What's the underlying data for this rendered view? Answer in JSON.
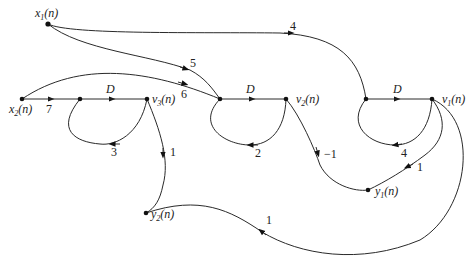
{
  "diagram": {
    "type": "signal-flow-graph",
    "nodes": {
      "x1": {
        "label": "x",
        "sub": "1",
        "arg": "(n)"
      },
      "x2": {
        "label": "x",
        "sub": "2",
        "arg": "(n)"
      },
      "v3": {
        "label": "v",
        "sub": "3",
        "arg": "(n)"
      },
      "v2": {
        "label": "v",
        "sub": "2",
        "arg": "(n)"
      },
      "v1": {
        "label": "v",
        "sub": "1",
        "arg": "(n)"
      },
      "y1": {
        "label": "y",
        "sub": "1",
        "arg": "(n)"
      },
      "y2": {
        "label": "y",
        "sub": "2",
        "arg": "(n)"
      }
    },
    "edges": [
      {
        "from": "x2",
        "to": "a3",
        "gain": "7"
      },
      {
        "from": "a3",
        "to": "v3",
        "gain": "D"
      },
      {
        "from": "v3",
        "to": "a3",
        "gain": "3"
      },
      {
        "from": "v3",
        "to": "y2",
        "gain": "1"
      },
      {
        "from": "x2",
        "to": "a2",
        "gain": "6"
      },
      {
        "from": "x1",
        "to": "a2",
        "gain": "5"
      },
      {
        "from": "a2",
        "to": "v2",
        "gain": "D"
      },
      {
        "from": "v2",
        "to": "a2",
        "gain": "2"
      },
      {
        "from": "v2",
        "to": "y1",
        "gain": "-1"
      },
      {
        "from": "x1",
        "to": "a1",
        "gain": "4"
      },
      {
        "from": "a1",
        "to": "v1",
        "gain": "D"
      },
      {
        "from": "v1",
        "to": "a1",
        "gain": "4"
      },
      {
        "from": "v1",
        "to": "y1",
        "gain": "1"
      },
      {
        "from": "v1",
        "to": "y2",
        "gain": "1"
      }
    ]
  },
  "labels": {
    "g7": "7",
    "g6": "6",
    "g5": "5",
    "g4": "4",
    "gD3": "D",
    "gD2": "D",
    "gD1": "D",
    "g3": "3",
    "g2": "2",
    "g4b": "4",
    "g1_v3y2": "1",
    "gm1": "−1",
    "g1_v1y1": "1",
    "g1_v1y2": "1"
  }
}
